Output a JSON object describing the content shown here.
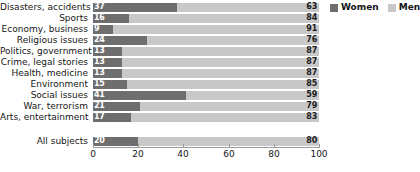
{
  "chart_data": {
    "type": "bar",
    "subtype": "stacked-horizontal-100",
    "title": "",
    "subtitle": "",
    "xlabel": "",
    "ylabel": "",
    "xlim": [
      0,
      100
    ],
    "xticks": [
      0,
      20,
      40,
      60,
      80,
      100
    ],
    "xticklabels": [
      "0",
      "20",
      "40",
      "60",
      "80",
      "100"
    ],
    "grid": false,
    "legend_position": "top-right",
    "categories": [
      "Disasters, accidents",
      "Sports",
      "Economy, business",
      "Religious issues",
      "Politics, government",
      "Crime, legal stories",
      "Health, medicine",
      "Environment",
      "Social issues",
      "War, terrorism",
      "Arts, entertainment",
      "All subjects"
    ],
    "series": [
      {
        "name": "Women",
        "color": "#6e6e6e",
        "values": [
          37,
          16,
          9,
          24,
          13,
          13,
          13,
          15,
          41,
          21,
          17,
          20
        ]
      },
      {
        "name": "Men",
        "color": "#c8c8c8",
        "values": [
          63,
          84,
          91,
          76,
          87,
          87,
          87,
          85,
          59,
          79,
          83,
          80
        ]
      }
    ],
    "summary_row_index": 11
  },
  "legend": {
    "entries": [
      {
        "label": "Women",
        "color": "#6e6e6e",
        "swatch": "legend-swatch-women"
      },
      {
        "label": "Men",
        "color": "#c8c8c8",
        "swatch": "legend-swatch-men"
      }
    ]
  }
}
